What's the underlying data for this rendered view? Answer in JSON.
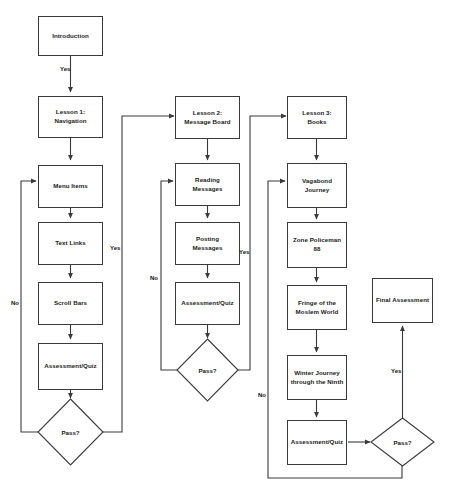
{
  "diagram": {
    "background_color": "#ffffff",
    "line_color": "#3a3a3a",
    "text_color": "#1a1a1a"
  },
  "columns": {
    "lesson1": {
      "nodes": [
        {
          "id": "introduction",
          "label": "Introduction",
          "shape": "box"
        },
        {
          "id": "lesson1",
          "label": "Lesson 1:\nNavigation",
          "shape": "box"
        },
        {
          "id": "menu_items",
          "label": "Menu Items",
          "shape": "box"
        },
        {
          "id": "text_links",
          "label": "Text Links",
          "shape": "box"
        },
        {
          "id": "scroll_bars",
          "label": "Scroll Bars",
          "shape": "box"
        },
        {
          "id": "assessment_quiz_1",
          "label": "Assessment/Quiz",
          "shape": "box"
        },
        {
          "id": "pass_1",
          "label": "Pass?",
          "shape": "diamond"
        }
      ]
    },
    "lesson2": {
      "nodes": [
        {
          "id": "lesson2",
          "label": "Lesson 2:\nMessage Board",
          "shape": "box"
        },
        {
          "id": "reading_messages",
          "label": "Reading\nMessages",
          "shape": "box"
        },
        {
          "id": "posting_messages",
          "label": "Posting\nMessages",
          "shape": "box"
        },
        {
          "id": "assessment_quiz_2",
          "label": "Assessment/Quiz",
          "shape": "box"
        },
        {
          "id": "pass_2",
          "label": "Pass?",
          "shape": "diamond"
        }
      ]
    },
    "lesson3": {
      "nodes": [
        {
          "id": "lesson3",
          "label": "Lesson 3:\nBooks",
          "shape": "box"
        },
        {
          "id": "vagabond_journey",
          "label": "Vagabond\nJourney",
          "shape": "box"
        },
        {
          "id": "zone_policeman",
          "label": "Zone Policeman\n88",
          "shape": "box"
        },
        {
          "id": "fringe_moslem",
          "label": "Fringe of the\nMoslem World",
          "shape": "box"
        },
        {
          "id": "winter_journey",
          "label": "Winter Journey\nthrough the Ninth",
          "shape": "box"
        },
        {
          "id": "assessment_quiz_3",
          "label": "Assessment/Quiz",
          "shape": "box"
        },
        {
          "id": "pass_3",
          "label": "Pass?",
          "shape": "diamond"
        }
      ]
    },
    "final": {
      "nodes": [
        {
          "id": "final_assessment",
          "label": "Final Assessment",
          "shape": "box"
        }
      ]
    }
  },
  "edge_labels": {
    "intro_to_lesson1": "Yes",
    "pass1_no": "No",
    "pass1_yes": "Yes",
    "pass2_no": "No",
    "pass2_yes": "Yes",
    "pass3_no": "No",
    "pass3_yes": "Yes"
  }
}
